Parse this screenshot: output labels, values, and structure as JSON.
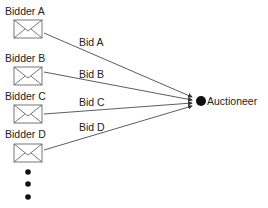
{
  "diagram": {
    "bidders": [
      {
        "label": "Bidder A",
        "bid": "Bid A"
      },
      {
        "label": "Bidder B",
        "bid": "Bid B"
      },
      {
        "label": "Bidder C",
        "bid": "Bid C"
      },
      {
        "label": "Bidder D",
        "bid": "Bid D"
      }
    ],
    "auctioneer": {
      "label": "Auctioneer"
    },
    "continuation": "ellipsis-dots",
    "colors": {
      "line": "#333333",
      "envelope": "#555555",
      "node": "#111111"
    }
  }
}
